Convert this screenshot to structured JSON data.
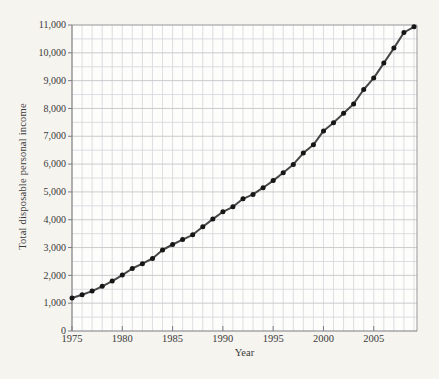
{
  "figure": {
    "background": "#f6f4ef",
    "plot_background": "#fdfdfc"
  },
  "chart_data": {
    "type": "line",
    "title": "",
    "xlabel": "Year",
    "ylabel": "Total disposable personal income",
    "x": [
      1975,
      1976,
      1977,
      1978,
      1979,
      1980,
      1981,
      1982,
      1983,
      1984,
      1985,
      1986,
      1987,
      1988,
      1989,
      1990,
      1991,
      1992,
      1993,
      1994,
      1995,
      1996,
      1997,
      1998,
      1999,
      2000,
      2001,
      2002,
      2003,
      2004,
      2005,
      2006,
      2007,
      2008,
      2009
    ],
    "values": [
      1187,
      1302,
      1435,
      1608,
      1793,
      2009,
      2246,
      2421,
      2608,
      2912,
      3109,
      3285,
      3458,
      3748,
      4021,
      4286,
      4464,
      4751,
      4912,
      5151,
      5408,
      5688,
      5989,
      6396,
      6695,
      7194,
      7487,
      7830,
      8163,
      8681,
      9092,
      9629,
      10171,
      10729,
      10937
    ],
    "xlim": [
      1975,
      2009.3
    ],
    "ylim": [
      0,
      11000
    ],
    "x_ticks": [
      1975,
      1980,
      1985,
      1990,
      1995,
      2000,
      2005
    ],
    "x_tick_labels": [
      "1975",
      "1980",
      "1985",
      "1990",
      "1995",
      "2000",
      "2005"
    ],
    "y_ticks": [
      0,
      1000,
      2000,
      3000,
      4000,
      5000,
      6000,
      7000,
      8000,
      9000,
      10000,
      11000
    ],
    "y_tick_labels": [
      "0",
      "1,000",
      "2,000",
      "3,000",
      "4,000",
      "5,000",
      "6,000",
      "7,000",
      "8,000",
      "9,000",
      "10,000",
      "11,000"
    ],
    "grid": {
      "x_step_years": 1,
      "y_minor_step": 500,
      "enabled": true
    },
    "legend": null,
    "marker": "filled-circle",
    "colors": {
      "line": "#474747",
      "marker": "#161616",
      "grid_major": "#c6c6ca",
      "grid_minor": "#d6d6da",
      "frame": "#97979b",
      "axis": "#7d7d82",
      "text": "#3a3a3a"
    }
  }
}
